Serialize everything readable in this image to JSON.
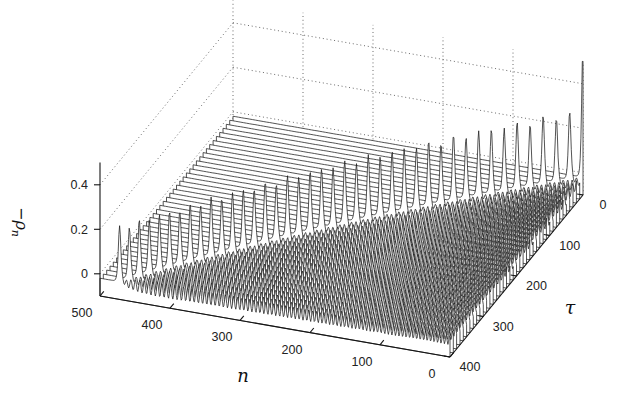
{
  "figure": {
    "background": "#ffffff",
    "surface_fill": "#ffffff",
    "line_color": "#1b1b1b",
    "grid_dot_color": "#5a5a5a",
    "axis_color": "#151515",
    "tick_label_color": "#222222"
  },
  "axes": {
    "x": {
      "label": "n",
      "lim": [
        0,
        500
      ],
      "ticks": [
        500,
        400,
        300,
        200,
        100,
        0
      ]
    },
    "y": {
      "label": "τ",
      "lim": [
        0,
        400
      ],
      "ticks": [
        0,
        100,
        200,
        300,
        400
      ]
    },
    "z": {
      "label_main": "−ρ",
      "label_sub": "n",
      "lim": [
        -0.1,
        0.5
      ],
      "ticks": [
        "0",
        "0.2",
        "0.4"
      ],
      "tick_values": [
        0,
        0.2,
        0.4
      ]
    }
  },
  "chart_data": {
    "type": "mesh3d",
    "title": "",
    "xlabel": "n",
    "ylabel": "τ",
    "zlabel": "−ρn",
    "tau_slices": {
      "start": 0,
      "end": 400,
      "step": 10
    },
    "n_samples": {
      "start": 0,
      "end": 500,
      "fine_step": 1,
      "coarse_step": 4
    },
    "zlim": [
      -0.1,
      0.5
    ],
    "model": {
      "background_level": -0.02,
      "front": {
        "initial_speed": 1.44,
        "deceleration": 0.00065
      },
      "soliton": {
        "amp_tau0": 0.62,
        "amp_early": 0.3,
        "amp_late": 0.24,
        "width_sites": 2.4,
        "alternation": 0.05
      },
      "wake": {
        "amplitude": 0.036,
        "wavelength_sites": 6.5,
        "rise_sites": 18,
        "decay_sites": 350,
        "floor_fraction": 0.45,
        "chirp": 0.00035,
        "mean_dip": 0.006
      }
    },
    "projection": {
      "screen_n500_tau400": [
        100,
        296
      ],
      "screen_n0_tau400": [
        450,
        357
      ],
      "screen_n0_tau0": [
        583,
        195
      ],
      "z_px_per_unit": 222.5
    }
  }
}
